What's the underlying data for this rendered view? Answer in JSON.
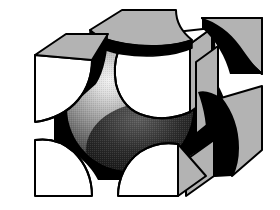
{
  "figure": {
    "title": "Sphere–Cube Constructive Solid Geometry Illustration",
    "caption": "",
    "canvas": {
      "width": 280,
      "height": 210,
      "background": "#ffffff"
    },
    "style": {
      "outline_color": "#000000",
      "outline_width": 2,
      "face_light": "#ffffff",
      "face_mid": "#b3b3b3",
      "face_shadow": "#000000",
      "sphere_highlight": "#f0f0f0",
      "sphere_mid": "#8a8a8a",
      "sphere_dark": "#0a0a0a"
    },
    "parts": [
      {
        "id": "corner-top-back",
        "label": "Top back corner piece",
        "fill": "face_mid"
      },
      {
        "id": "corner-top-right",
        "label": "Top right corner piece",
        "fill": "face_mid"
      },
      {
        "id": "corner-left-upper",
        "label": "Upper left corner piece",
        "fill": "face_light"
      },
      {
        "id": "corner-front-top",
        "label": "Front top corner piece",
        "fill": "face_light"
      },
      {
        "id": "corner-right-upper",
        "label": "Upper right corner piece",
        "fill": "face_mid"
      },
      {
        "id": "corner-right-lower",
        "label": "Lower right corner piece",
        "fill": "face_mid"
      },
      {
        "id": "corner-left-lower",
        "label": "Lower left corner piece",
        "fill": "face_light"
      },
      {
        "id": "corner-front-bottom",
        "label": "Front bottom corner piece",
        "fill": "face_light"
      },
      {
        "id": "sphere-core",
        "label": "Shaded sphere core",
        "fill": "sphere_mid"
      },
      {
        "id": "cavity-shadow",
        "label": "Spherical cavity shadow",
        "fill": "face_shadow"
      }
    ],
    "labels": {
      "sphere": "sphere",
      "cube": "cube"
    }
  }
}
